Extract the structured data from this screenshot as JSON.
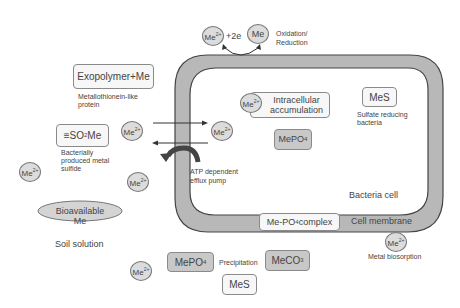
{
  "diagram": {
    "ions": {
      "me2_top": "Me2+",
      "me_top": "Me",
      "me2_intracellular": "Me2+",
      "me2_outside_left": "Me2+",
      "me2_inside_arrow": "Me2+",
      "me2_far_left": "Me2+",
      "me2_efflux": "Me2+",
      "me2_bottom": "Me2+",
      "me2_biosorption": "Me2+"
    },
    "text": {
      "plus_2e": "+2e",
      "oxidation_reduction_1": "Oxidation/",
      "oxidation_reduction_2": "Reduction",
      "exopolymer": "Exopolymer+Me",
      "metallothionein_1": "Metallothionein-like",
      "metallothionein_2": "protein",
      "so2me_prefix": "≡SO",
      "so2me_sub": "2",
      "so2me_suffix": "Me",
      "bact_sulfide_1": "Bacterially",
      "bact_sulfide_2": "produced metal",
      "bact_sulfide_3": "sulfide",
      "intracellular_1": "Intracellular",
      "intracellular_2": "accumulation",
      "mes_inside": "MeS",
      "sulfate_1": "Sulfate reducing",
      "sulfate_2": "bacteria",
      "mepo4_inside": "MePO",
      "mepo4_inside_sub": "4",
      "atp_1": "ATP dependent",
      "atp_2": "efflux pump",
      "bioavailable": "Bioavailable Me",
      "bacteria_cell": "Bacteria cell",
      "mepo4_complex": "Me-PO",
      "mepo4_complex_sub": "4",
      "mepo4_complex_suffix": " complex",
      "cell_membrane": "Cell membrane",
      "soil_solution": "Soil solution",
      "metal_biosorption": "Metal biosorption",
      "mepo4_bottom": "MePO",
      "mepo4_bottom_sub": "4",
      "precipitation": "Precipitation",
      "meco3": "MeCO",
      "meco3_sub": "3",
      "mes_bottom": "MeS"
    },
    "colors": {
      "membrane_fill": "#b8b8b8",
      "membrane_stroke": "#444444",
      "ion_fill": "#dcdcdc",
      "box_grey": "#c8c8c8",
      "arrow": "#333333"
    }
  }
}
